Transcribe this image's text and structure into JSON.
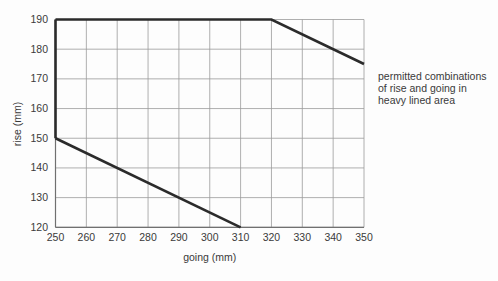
{
  "chart_data": {
    "type": "line",
    "title": "",
    "xlabel": "going (mm)",
    "ylabel": "rise (mm)",
    "xlim": [
      250,
      350
    ],
    "ylim": [
      120,
      190
    ],
    "xticks": [
      250,
      260,
      270,
      280,
      290,
      300,
      310,
      320,
      330,
      340,
      350
    ],
    "yticks": [
      120,
      130,
      140,
      150,
      160,
      170,
      180,
      190
    ],
    "grid": true,
    "legend": "none",
    "series": [
      {
        "name": "upper-permitted-boundary",
        "style": "heavy",
        "points": [
          [
            250,
            190
          ],
          [
            320,
            190
          ],
          [
            350,
            175
          ]
        ]
      },
      {
        "name": "left-permitted-boundary",
        "style": "heavy",
        "points": [
          [
            250,
            150
          ],
          [
            250,
            190
          ]
        ]
      },
      {
        "name": "lower-permitted-boundary",
        "style": "heavy",
        "points": [
          [
            250,
            150
          ],
          [
            310,
            120
          ]
        ]
      }
    ],
    "annotation": {
      "lines": [
        "permitted combinations",
        "of rise and going in",
        "heavy lined area"
      ]
    }
  },
  "colors": {
    "background": "#fdfdfd",
    "grid_line": "#9b9b9b",
    "axis_line": "#707070",
    "heavy_line": "#2b2b2b",
    "text": "#3a3a3a"
  }
}
